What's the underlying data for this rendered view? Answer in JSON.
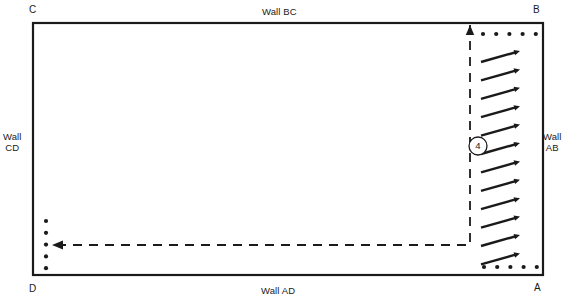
{
  "diagram": {
    "background_color": "#ffffff",
    "line_color": "#1a1a1a",
    "room": {
      "x": 33,
      "y": 23,
      "width": 510,
      "height": 252,
      "border_width": 2.2
    },
    "corner_labels": [
      {
        "name": "corner-label-c",
        "text": "C",
        "x": 29,
        "y": 4
      },
      {
        "name": "corner-label-b",
        "text": "B",
        "x": 533,
        "y": 4
      },
      {
        "name": "corner-label-d",
        "text": "D",
        "x": 29,
        "y": 283
      },
      {
        "name": "corner-label-a",
        "text": "A",
        "x": 534,
        "y": 282
      }
    ],
    "wall_labels": [
      {
        "name": "wall-label-bc",
        "text": "Wall BC",
        "x": 262,
        "y": 6
      },
      {
        "name": "wall-label-ad",
        "text": "Wall AD",
        "x": 261,
        "y": 285
      },
      {
        "name": "wall-label-cd",
        "line1": "Wall",
        "line2": "CD",
        "x": 3,
        "y": 131
      },
      {
        "name": "wall-label-ab",
        "line1": "Wall",
        "line2": "AB",
        "x": 543,
        "y": 131
      }
    ],
    "marker": {
      "name": "region-marker-4",
      "label": "4",
      "cx": 478,
      "cy": 146,
      "r": 9,
      "font_size": 9.5
    },
    "dashed_path": {
      "name": "dashed-flow-path",
      "dash_pattern": "9 7",
      "stroke_width": 1.8,
      "vertical_x": 470,
      "vertical_top_y": 25,
      "corner_y": 245,
      "horizontal_left_x": 52,
      "arrowheads": [
        "up",
        "left"
      ]
    },
    "arrow_column": {
      "name": "flow-arrow-column",
      "count": 12,
      "tail_x": 481,
      "head_x": 520,
      "first_tail_y": 62,
      "spacing": 18.4,
      "rise": 11,
      "stroke_width": 2.4,
      "head_size": 6.5
    },
    "dot_rows": [
      {
        "name": "dot-row-top",
        "orientation": "horizontal",
        "count": 5,
        "y": 34,
        "start_x": 483,
        "spacing": 13.2,
        "r": 2.1
      },
      {
        "name": "dot-row-bottom",
        "orientation": "horizontal",
        "count": 5,
        "y": 267,
        "start_x": 484,
        "spacing": 13.2,
        "r": 2.1
      },
      {
        "name": "dot-column-left",
        "orientation": "vertical",
        "count": 5,
        "x": 46,
        "start_y": 221,
        "spacing": 11.8,
        "r": 2.1
      }
    ]
  }
}
